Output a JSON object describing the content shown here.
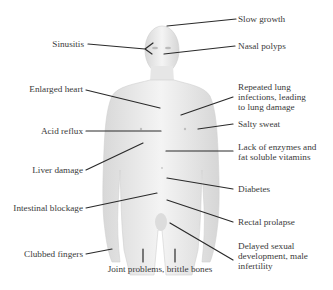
{
  "diagram": {
    "line_color": "#2a2a2a",
    "body_color": "#e8e8e8",
    "labels": {
      "slow_growth": "Slow growth",
      "sinusitis": "Sinusitis",
      "nasal_polyps": "Nasal polyps",
      "enlarged_heart": "Enlarged heart",
      "repeated_lung": "Repeated lung\ninfections, leading\nto lung damage",
      "acid_reflux": "Acid reflux",
      "salty_sweat": "Salty sweat",
      "lack_enzymes": "Lack of enzymes and\nfat soluble vitamins",
      "liver_damage": "Liver damage",
      "diabetes": "Diabetes",
      "intestinal_blockage": "Intestinal blockage",
      "rectal_prolapse": "Rectal prolapse",
      "clubbed_fingers": "Clubbed fingers",
      "delayed_sexual": "Delayed sexual\ndevelopment, male\ninfertility",
      "joint_problems": "Joint problems, brittle bones"
    }
  }
}
